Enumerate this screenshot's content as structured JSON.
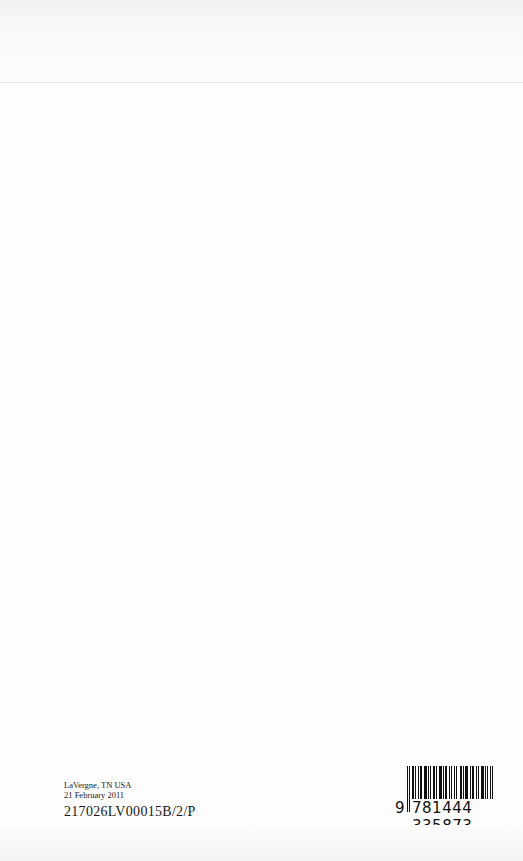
{
  "page": {
    "type": "book-back-page"
  },
  "colophon": {
    "location": "LaVergne, TN USA",
    "date": "21 February 2011",
    "print_code": "217026LV00015B/2/P"
  },
  "barcode": {
    "lead_digit": "9",
    "group1": "781444",
    "group2": "335873",
    "isbn": "9781444335873"
  }
}
